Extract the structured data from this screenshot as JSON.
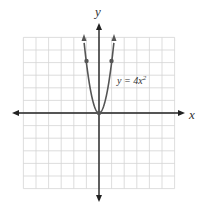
{
  "chart_data": {
    "type": "line",
    "title": "",
    "xlabel": "x",
    "ylabel": "y",
    "xlim": [
      -6,
      6
    ],
    "ylim": [
      -6,
      6
    ],
    "grid": true,
    "series": [
      {
        "name": "y = 4x^2",
        "equation": "y = 4x²",
        "points": [
          [
            -1.2,
            5.76
          ],
          [
            -1,
            4
          ],
          [
            -0.5,
            1
          ],
          [
            0,
            0
          ],
          [
            0.5,
            1
          ],
          [
            1,
            4
          ],
          [
            1.2,
            5.76
          ]
        ],
        "marked_points": [
          [
            -1,
            4
          ],
          [
            0,
            0
          ],
          [
            1,
            4
          ]
        ]
      }
    ],
    "annotations": [
      {
        "text": "y = 4x",
        "superscript": "2",
        "x": 1.6,
        "y": 2.6
      }
    ]
  },
  "labels": {
    "x_axis": "x",
    "y_axis": "y",
    "equation_main": "y = 4x",
    "equation_sup": "2"
  },
  "colors": {
    "grid": "#d4d4d4",
    "axis": "#222222",
    "curve": "#555555",
    "text": "#333333"
  }
}
